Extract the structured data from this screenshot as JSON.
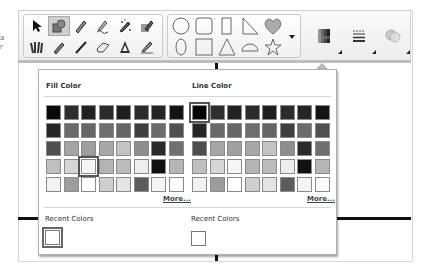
{
  "side_text": [
    "a",
    "r"
  ],
  "toolbar": {
    "tools_row1": [
      {
        "name": "select-arrow-icon",
        "active": false
      },
      {
        "name": "fill-shape-icon",
        "active": true
      },
      {
        "name": "pen-icon",
        "active": false
      },
      {
        "name": "handwriting-pen-icon",
        "active": false
      },
      {
        "name": "magic-pen-icon",
        "active": false
      },
      {
        "name": "highlight-pen-icon",
        "active": false
      }
    ],
    "tools_row2": [
      {
        "name": "pen-set-icon",
        "active": false
      },
      {
        "name": "pencil-icon",
        "active": false
      },
      {
        "name": "line-icon",
        "active": false
      },
      {
        "name": "eraser-icon",
        "active": false
      },
      {
        "name": "text-a-icon",
        "active": false
      },
      {
        "name": "marker-pen-icon",
        "active": false
      }
    ],
    "shapes_row1": [
      "circle-shape-icon",
      "rounded-square-shape-icon",
      "tall-rectangle-shape-icon",
      "right-triangle-shape-icon",
      "heart-shape-icon"
    ],
    "shapes_row2": [
      "ellipse-shape-icon",
      "square-shape-icon",
      "triangle-shape-icon",
      "half-circle-shape-icon",
      "star-shape-icon"
    ],
    "shapes_more": "dropdown-arrow-icon",
    "buttons": [
      {
        "name": "color-palette-button",
        "icon": "color-grid-icon"
      },
      {
        "name": "line-style-button",
        "icon": "line-style-icon"
      },
      {
        "name": "effects-button",
        "icon": "transparency-icon"
      }
    ]
  },
  "popup": {
    "fill": {
      "title": "Fill Color",
      "more": "More...",
      "selected": [
        3,
        2
      ],
      "colors": [
        [
          "#0a0a0a",
          "#2e2e2e",
          "#222222",
          "#2a2a2a",
          "#1e1e1e",
          "#2b2b2b",
          "#252525",
          "#141414"
        ],
        [
          "#262626",
          "#6a6a6a",
          "#666666",
          "#6e6e6e",
          "#656565",
          "#3f3f3f",
          "#6c6c6c",
          "#505050"
        ],
        [
          "#4f4f4f",
          "#a5a5a5",
          "#9f9f9f",
          "#a8a8a8",
          "#c3c3c3",
          "#8e8e8e",
          "#2a2a2a",
          "#707070"
        ],
        [
          "#bfbfbf",
          "#d6d6d6",
          "#f6f6f6",
          "#b4b4b4",
          "#bcbcbc",
          "#eeeeee",
          "#111111",
          "#b6b6b6"
        ],
        [
          "#f2f2f2",
          "#9d9d9d",
          "#ffffff",
          "#cfcfcf",
          "#e4e4e4",
          "#5c5c5c",
          "#f4f4f4",
          "#fbfbfb"
        ]
      ]
    },
    "line": {
      "title": "Line Color",
      "more": "More...",
      "selected": [
        0,
        0
      ],
      "colors": [
        [
          "#050505",
          "#2e2e2e",
          "#222222",
          "#2a2a2a",
          "#1e1e1e",
          "#2b2b2b",
          "#252525",
          "#141414"
        ],
        [
          "#262626",
          "#6a6a6a",
          "#666666",
          "#6e6e6e",
          "#656565",
          "#3f3f3f",
          "#6c6c6c",
          "#505050"
        ],
        [
          "#4f4f4f",
          "#a5a5a5",
          "#9f9f9f",
          "#a8a8a8",
          "#c3c3c3",
          "#8e8e8e",
          "#2a2a2a",
          "#707070"
        ],
        [
          "#bfbfbf",
          "#d6d6d6",
          "#f6f6f6",
          "#b4b4b4",
          "#bcbcbc",
          "#eeeeee",
          "#111111",
          "#b6b6b6"
        ],
        [
          "#f2f2f2",
          "#9d9d9d",
          "#ffffff",
          "#cfcfcf",
          "#e4e4e4",
          "#5c5c5c",
          "#f4f4f4",
          "#fbfbfb"
        ]
      ]
    },
    "recent_fill": {
      "title": "Recent Colors",
      "colors": [
        "#ffffff"
      ]
    },
    "recent_line": {
      "title": "Recent Colors",
      "colors": [
        "#ffffff"
      ]
    }
  }
}
